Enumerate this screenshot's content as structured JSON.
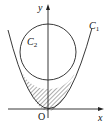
{
  "diagram": {
    "axes": {
      "x_label": "x",
      "y_label": "y",
      "origin_label": "O"
    },
    "curves": [
      {
        "name": "C",
        "subscript": "1",
        "type": "parabola"
      },
      {
        "name": "C",
        "subscript": "2",
        "type": "circle"
      }
    ],
    "shaded_region": "between parabola C1 and lower arc of circle C2",
    "colors": {
      "stroke": "#222222",
      "background": "#ffffff"
    }
  }
}
